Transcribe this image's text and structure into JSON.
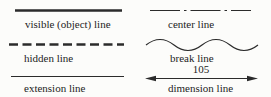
{
  "figure": {
    "colors": {
      "background": "#fcfcfa",
      "line": "#2b2b2b",
      "text": "#1d1d1d"
    },
    "left_column": {
      "items": [
        {
          "id": "visible-line",
          "label": "visible (object) line"
        },
        {
          "id": "hidden-line",
          "label": "hidden line"
        },
        {
          "id": "extension-line",
          "label": "extension line"
        }
      ]
    },
    "right_column": {
      "items": [
        {
          "id": "center-line",
          "label": "center line"
        },
        {
          "id": "break-line",
          "label": "break line"
        },
        {
          "id": "dimension-line",
          "label": "dimension line",
          "dimension_value": "105"
        }
      ]
    }
  }
}
